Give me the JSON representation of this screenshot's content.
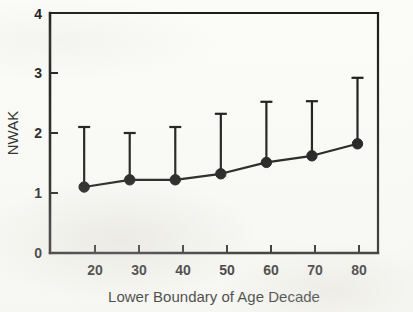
{
  "chart_data": {
    "type": "line",
    "title": "",
    "subtitle": "",
    "xlabel": "Lower Boundary of Age Decade",
    "ylabel": "NWAK",
    "x": [
      20,
      30,
      40,
      50,
      60,
      70,
      80
    ],
    "xtick_labels": [
      "20",
      "30",
      "40",
      "50",
      "60",
      "70",
      "80"
    ],
    "ytick_labels": [
      "0",
      "1",
      "2",
      "3",
      "4"
    ],
    "yticks": [
      0,
      1,
      2,
      3,
      4
    ],
    "xlim": [
      12.5,
      84.5
    ],
    "ylim": [
      0,
      4
    ],
    "grid": false,
    "legend": "none",
    "marker": "filled-circle",
    "error_bars": "upper-only",
    "series": [
      {
        "name": "NWAK",
        "values": [
          1.1,
          1.22,
          1.22,
          1.32,
          1.51,
          1.62,
          1.82
        ],
        "error_upper": [
          2.1,
          2.0,
          2.1,
          2.32,
          2.52,
          2.53,
          2.92
        ],
        "color": "#111111"
      }
    ],
    "points": [
      {
        "x": 20,
        "y": 1.1,
        "upper": 2.1
      },
      {
        "x": 30,
        "y": 1.22,
        "upper": 2.0
      },
      {
        "x": 40,
        "y": 1.22,
        "upper": 2.1
      },
      {
        "x": 50,
        "y": 1.32,
        "upper": 2.32
      },
      {
        "x": 60,
        "y": 1.51,
        "upper": 2.52
      },
      {
        "x": 70,
        "y": 1.62,
        "upper": 2.53
      },
      {
        "x": 80,
        "y": 1.82,
        "upper": 2.92
      }
    ]
  },
  "colors": {
    "ink": "#111111",
    "axis": "#1a1a1a",
    "paper": "#fbfbf8"
  }
}
